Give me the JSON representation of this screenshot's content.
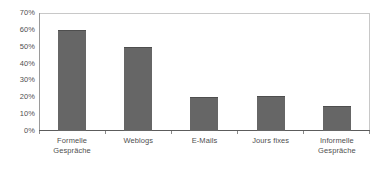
{
  "chart_data": {
    "type": "bar",
    "title": "",
    "subtitle": "",
    "xlabel": "",
    "ylabel": "",
    "categories": [
      "Formelle Gespräche",
      "Weblogs",
      "E-Mails",
      "Jours fixes",
      "Informelle Gespräche"
    ],
    "category_lines": [
      [
        "Formelle",
        "Gespräche"
      ],
      [
        "Weblogs"
      ],
      [
        "E-Mails"
      ],
      [
        "Jours fixes"
      ],
      [
        "Informelle",
        "Gespräche"
      ]
    ],
    "values": [
      60,
      50,
      20,
      21,
      15
    ],
    "value_labels": [
      "60%",
      "50%",
      "20%",
      "21%",
      "15%"
    ],
    "ylim": [
      0,
      70
    ],
    "ytick_values": [
      0,
      10,
      20,
      30,
      40,
      50,
      60,
      70
    ],
    "ytick_labels": [
      "0%",
      "10%",
      "20%",
      "30%",
      "40%",
      "50%",
      "60%",
      "70%"
    ],
    "grid": false,
    "legend": false,
    "legend_position": "none",
    "bar_color": "#666666",
    "bar_edge_color": "#4e4e4e",
    "plot_border_color": "#c8c8c8",
    "axis_color": "#5c5c5c",
    "text_color": "#4f4f4f",
    "background_color": "#ffffff"
  }
}
